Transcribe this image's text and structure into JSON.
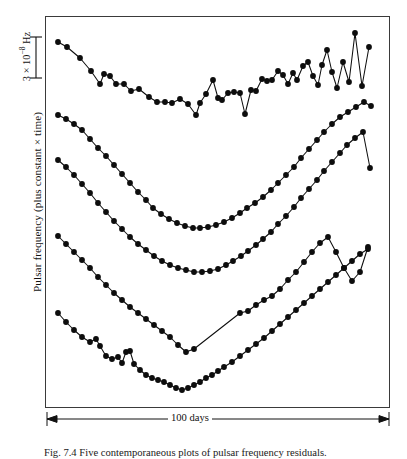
{
  "figure": {
    "domain": "chart",
    "caption_number": "Fig. 7.4",
    "caption_text": "Fig. 7.4  Five contemporaneous plots of pulsar frequency residuals.",
    "background_color": "#ffffff",
    "ink_color": "#0d0d0d"
  },
  "axes": {
    "y_label": "Pulsar frequency (plus constant × time)",
    "scalebar": {
      "value": "3",
      "multiplier": "× 10",
      "exponent": "−8",
      "unit": "Hz",
      "label_full": "3 × 10⁻⁸ Hz"
    },
    "x_scalebar": {
      "label": "100 days",
      "arrow": "double-headed"
    },
    "frame": {
      "left": 45,
      "top": 16,
      "right": 390,
      "bottom": 408,
      "border_color": "#3a3a3a"
    },
    "ticks_visible": false,
    "grid": false
  },
  "chart_data": {
    "type": "line",
    "title": "",
    "subtitle": "",
    "xlabel": "100 days",
    "ylabel": "Pulsar frequency (plus constant × time)",
    "xlim": [
      0,
      100
    ],
    "ylim": [
      0,
      1
    ],
    "grid": false,
    "legend": "none",
    "axis_note": "Vertical scale bar denotes 3 × 10⁻⁸ Hz; horizontal arrow denotes 100 days. Curves are offset vertically by arbitrary constants.",
    "marker": "filled-circle",
    "series": [
      {
        "name": "pulsar-1",
        "note": "topmost trace; steep decline then large erratic scatter on right",
        "points": [
          [
            58,
            42
          ],
          [
            67,
            47
          ],
          [
            80,
            58
          ],
          [
            91,
            71
          ],
          [
            100,
            84
          ],
          [
            104,
            74
          ],
          [
            110,
            76
          ],
          [
            116,
            84
          ],
          [
            124,
            84
          ],
          [
            131,
            91
          ],
          [
            139,
            89
          ],
          [
            149,
            97
          ],
          [
            157,
            102
          ],
          [
            165,
            102
          ],
          [
            172,
            103
          ],
          [
            180,
            99
          ],
          [
            188,
            104
          ],
          [
            196,
            115
          ],
          [
            200,
            103
          ],
          [
            206,
            94
          ],
          [
            213,
            80
          ],
          [
            218,
            98
          ],
          [
            222,
            100
          ],
          [
            228,
            93
          ],
          [
            234,
            92
          ],
          [
            240,
            93
          ],
          [
            245,
            114
          ],
          [
            251,
            90
          ],
          [
            256,
            91
          ],
          [
            262,
            79
          ],
          [
            267,
            81
          ],
          [
            272,
            80
          ],
          [
            278,
            71
          ],
          [
            283,
            75
          ],
          [
            288,
            84
          ],
          [
            293,
            73
          ],
          [
            297,
            80
          ],
          [
            303,
            66
          ],
          [
            308,
            62
          ],
          [
            313,
            76
          ],
          [
            318,
            85
          ],
          [
            322,
            65
          ],
          [
            327,
            50
          ],
          [
            332,
            72
          ],
          [
            337,
            88
          ],
          [
            343,
            62
          ],
          [
            349,
            82
          ],
          [
            355,
            33
          ],
          [
            362,
            86
          ],
          [
            369,
            47
          ]
        ]
      },
      {
        "name": "pulsar-2",
        "note": "smooth broad parabola, gentle minimum near centre",
        "points": [
          [
            58,
            115
          ],
          [
            66,
            119
          ],
          [
            74,
            124
          ],
          [
            82,
            130
          ],
          [
            90,
            139
          ],
          [
            98,
            148
          ],
          [
            106,
            156
          ],
          [
            114,
            165
          ],
          [
            122,
            174
          ],
          [
            130,
            183
          ],
          [
            138,
            192
          ],
          [
            146,
            200
          ],
          [
            153,
            208
          ],
          [
            161,
            214
          ],
          [
            169,
            219
          ],
          [
            177,
            223
          ],
          [
            185,
            226
          ],
          [
            193,
            228
          ],
          [
            200,
            228
          ],
          [
            208,
            227
          ],
          [
            216,
            225
          ],
          [
            224,
            222
          ],
          [
            232,
            218
          ],
          [
            240,
            213
          ],
          [
            247,
            208
          ],
          [
            255,
            203
          ],
          [
            263,
            197
          ],
          [
            271,
            190
          ],
          [
            278,
            183
          ],
          [
            286,
            175
          ],
          [
            294,
            167
          ],
          [
            301,
            158
          ],
          [
            309,
            149
          ],
          [
            317,
            140
          ],
          [
            324,
            132
          ],
          [
            332,
            124
          ],
          [
            340,
            117
          ],
          [
            348,
            112
          ],
          [
            356,
            107
          ],
          [
            364,
            102
          ],
          [
            371,
            106
          ]
        ]
      },
      {
        "name": "pulsar-3",
        "note": "parabola offset below trace 2, slightly deeper curvature",
        "points": [
          [
            58,
            160
          ],
          [
            66,
            167
          ],
          [
            74,
            175
          ],
          [
            82,
            184
          ],
          [
            90,
            193
          ],
          [
            98,
            203
          ],
          [
            106,
            212
          ],
          [
            114,
            221
          ],
          [
            122,
            229
          ],
          [
            130,
            237
          ],
          [
            138,
            244
          ],
          [
            146,
            250
          ],
          [
            154,
            256
          ],
          [
            162,
            261
          ],
          [
            170,
            265
          ],
          [
            178,
            268
          ],
          [
            186,
            270
          ],
          [
            194,
            272
          ],
          [
            202,
            272
          ],
          [
            210,
            271
          ],
          [
            218,
            269
          ],
          [
            226,
            265
          ],
          [
            233,
            261
          ],
          [
            241,
            256
          ],
          [
            248,
            251
          ],
          [
            256,
            245
          ],
          [
            263,
            239
          ],
          [
            271,
            232
          ],
          [
            278,
            224
          ],
          [
            286,
            216
          ],
          [
            294,
            207
          ],
          [
            301,
            198
          ],
          [
            309,
            189
          ],
          [
            317,
            180
          ],
          [
            324,
            171
          ],
          [
            332,
            162
          ],
          [
            340,
            153
          ],
          [
            347,
            145
          ],
          [
            355,
            138
          ],
          [
            363,
            132
          ],
          [
            370,
            168
          ]
        ]
      },
      {
        "name": "pulsar-4",
        "note": "sharp V minimum with long straight interpolated segment across gap",
        "points": [
          [
            58,
            236
          ],
          [
            66,
            244
          ],
          [
            74,
            252
          ],
          [
            82,
            260
          ],
          [
            90,
            268
          ],
          [
            98,
            277
          ],
          [
            106,
            285
          ],
          [
            114,
            293
          ],
          [
            122,
            300
          ],
          [
            130,
            307
          ],
          [
            138,
            313
          ],
          [
            146,
            319
          ],
          [
            154,
            325
          ],
          [
            162,
            331
          ],
          [
            170,
            337
          ],
          [
            178,
            345
          ],
          [
            186,
            352
          ],
          [
            194,
            349
          ],
          [
            240,
            313
          ],
          [
            248,
            311
          ],
          [
            256,
            305
          ],
          [
            264,
            300
          ],
          [
            272,
            296
          ],
          [
            280,
            289
          ],
          [
            288,
            280
          ],
          [
            296,
            272
          ],
          [
            304,
            262
          ],
          [
            312,
            252
          ],
          [
            320,
            243
          ],
          [
            328,
            237
          ],
          [
            336,
            252
          ],
          [
            344,
            268
          ],
          [
            352,
            281
          ],
          [
            360,
            272
          ],
          [
            368,
            247
          ]
        ]
      },
      {
        "name": "pulsar-5",
        "note": "lowest trace; noisy wiggles on left half, smooth rise on right",
        "points": [
          [
            58,
            313
          ],
          [
            66,
            322
          ],
          [
            74,
            330
          ],
          [
            82,
            337
          ],
          [
            90,
            342
          ],
          [
            96,
            339
          ],
          [
            100,
            346
          ],
          [
            106,
            356
          ],
          [
            112,
            359
          ],
          [
            118,
            357
          ],
          [
            122,
            363
          ],
          [
            126,
            352
          ],
          [
            130,
            351
          ],
          [
            134,
            364
          ],
          [
            140,
            370
          ],
          [
            146,
            375
          ],
          [
            152,
            378
          ],
          [
            158,
            380
          ],
          [
            164,
            382
          ],
          [
            170,
            385
          ],
          [
            176,
            388
          ],
          [
            182,
            390
          ],
          [
            188,
            388
          ],
          [
            194,
            385
          ],
          [
            200,
            382
          ],
          [
            206,
            378
          ],
          [
            212,
            375
          ],
          [
            218,
            371
          ],
          [
            224,
            367
          ],
          [
            232,
            362
          ],
          [
            240,
            356
          ],
          [
            248,
            350
          ],
          [
            256,
            344
          ],
          [
            264,
            338
          ],
          [
            272,
            331
          ],
          [
            280,
            324
          ],
          [
            288,
            317
          ],
          [
            296,
            310
          ],
          [
            304,
            303
          ],
          [
            312,
            296
          ],
          [
            320,
            289
          ],
          [
            328,
            282
          ],
          [
            336,
            275
          ],
          [
            344,
            268
          ],
          [
            352,
            261
          ],
          [
            360,
            254
          ],
          [
            368,
            249
          ]
        ]
      }
    ]
  }
}
